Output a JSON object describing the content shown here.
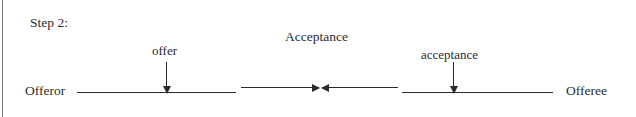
{
  "diagram": {
    "title": "Step 2:",
    "background_color": "#ffffff",
    "ink_color": "#2b2b2b",
    "parties": {
      "left": "Offeror",
      "right": "Offeree"
    },
    "headings": [
      {
        "id": "acceptance-heading",
        "text": "Acceptance"
      }
    ],
    "flow_labels": [
      {
        "id": "offer",
        "text": "offer",
        "direction": "down"
      },
      {
        "id": "acceptance",
        "text": "acceptance",
        "direction": "down"
      }
    ],
    "connectors": [
      {
        "id": "offer-transfer",
        "direction": "right"
      },
      {
        "id": "acceptance-transfer",
        "direction": "left"
      }
    ]
  }
}
